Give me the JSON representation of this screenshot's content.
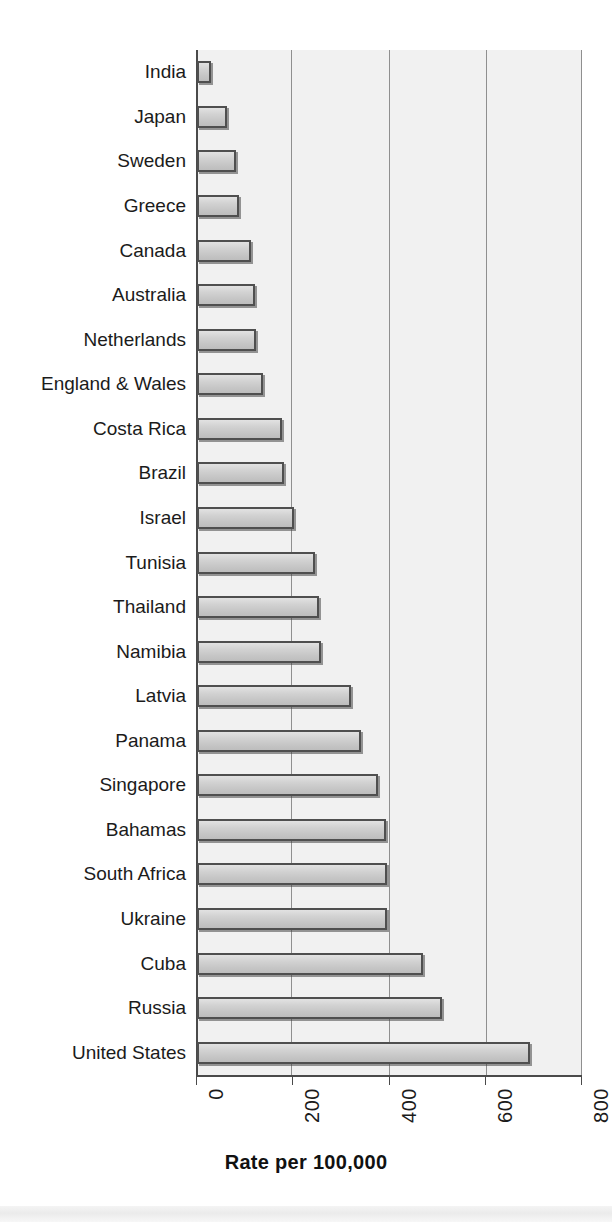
{
  "chart_data": {
    "type": "bar",
    "orientation": "horizontal",
    "title": "",
    "xlabel": "Rate per 100,000",
    "ylabel": "",
    "xlim": [
      0,
      800
    ],
    "xticks": [
      0,
      200,
      400,
      600,
      800
    ],
    "xtick_labels": [
      "0",
      "200",
      "400",
      "600",
      "800"
    ],
    "grid": true,
    "grid_axis": "x",
    "legend": false,
    "categories": [
      "India",
      "Japan",
      "Sweden",
      "Greece",
      "Canada",
      "Australia",
      "Netherlands",
      "England & Wales",
      "Costa Rica",
      "Brazil",
      "Israel",
      "Tunisia",
      "Thailand",
      "Namibia",
      "Latvia",
      "Panama",
      "Singapore",
      "Bahamas",
      "South Africa",
      "Ukraine",
      "Cuba",
      "Russia",
      "United States"
    ],
    "values": [
      29,
      62,
      81,
      87,
      112,
      120,
      122,
      137,
      176,
      180,
      201,
      245,
      253,
      257,
      319,
      340,
      377,
      392,
      394,
      394,
      469,
      510,
      692
    ]
  },
  "style": {
    "plot_background": "#f1f1f1",
    "bar_fill": "#cfcfcf",
    "bar_border": "#4f4f4f",
    "gridline_color": "#8f8f8f",
    "axis_color": "#4a4a4a",
    "text_color": "#1b1b1b"
  }
}
